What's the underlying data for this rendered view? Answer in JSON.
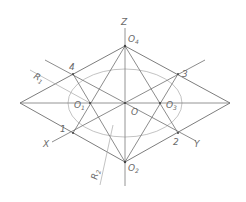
{
  "diagram": {
    "colors": {
      "line": "#6e6e6e",
      "thin": "#a8a8a8",
      "text": "#6a6a6a"
    },
    "labels": {
      "z_axis": "Z",
      "x_axis": "X",
      "y_axis": "Y",
      "center": "O",
      "o1": "O",
      "o1_sub": "1",
      "o2": "O",
      "o2_sub": "2",
      "o3": "O",
      "o3_sub": "3",
      "o4": "O",
      "o4_sub": "4",
      "p1": "1",
      "p2": "2",
      "p3": "3",
      "p4": "4",
      "r1": "R",
      "r1_sub": "1",
      "r2": "R",
      "r2_sub": "2"
    },
    "points": {
      "O": [
        125,
        103
      ],
      "O1": [
        90,
        103
      ],
      "O2": [
        125,
        162
      ],
      "O3": [
        160,
        103
      ],
      "O4": [
        125,
        46
      ],
      "P1": [
        73,
        133
      ],
      "P2": [
        178,
        133
      ],
      "P3": [
        178,
        74
      ],
      "P4": [
        73,
        74
      ],
      "left_vertex": [
        20,
        103
      ],
      "right_vertex": [
        230,
        103
      ]
    }
  }
}
